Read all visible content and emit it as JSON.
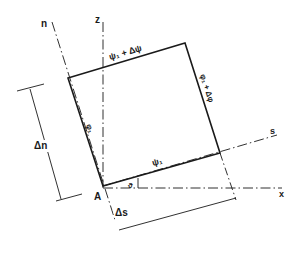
{
  "diagram": {
    "axes": {
      "z": "z",
      "n": "n",
      "s": "s",
      "x": "x"
    },
    "labels": {
      "top_edge": "ψ₁ + Δψ",
      "bottom_edge": "ψ₁",
      "left_edge": "φ₁",
      "right_edge": "φ₁ + Δφ",
      "origin": "A",
      "angle": "ϑ",
      "delta_n": "Δn",
      "delta_s": "Δs"
    },
    "colors": {
      "line": "#1a1a1a",
      "background": "#ffffff"
    }
  }
}
